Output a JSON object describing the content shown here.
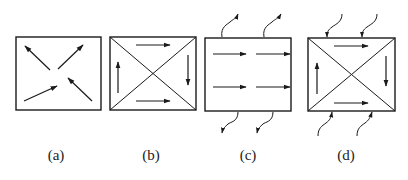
{
  "figure": {
    "ink_color": "#1a1a1a",
    "background": "#ffffff",
    "panels": [
      {
        "id": "a",
        "label": "(a)",
        "box": {
          "x": 16,
          "y": 37,
          "w": 85,
          "h": 73
        },
        "diagonals": false,
        "arrows": [
          {
            "x1": 50,
            "y1": 70,
            "x2": 25,
            "y2": 46
          },
          {
            "x1": 58,
            "y1": 69,
            "x2": 83,
            "y2": 45
          },
          {
            "x1": 24,
            "y1": 101,
            "x2": 57,
            "y2": 86
          },
          {
            "x1": 92,
            "y1": 101,
            "x2": 68,
            "y2": 78
          }
        ],
        "wavy_arrows": []
      },
      {
        "id": "b",
        "label": "(b)",
        "box": {
          "x": 110,
          "y": 37,
          "w": 86,
          "h": 73
        },
        "diagonals": true,
        "arrows": [
          {
            "x1": 136,
            "y1": 45,
            "x2": 170,
            "y2": 45
          },
          {
            "x1": 188,
            "y1": 55,
            "x2": 188,
            "y2": 85
          },
          {
            "x1": 136,
            "y1": 101,
            "x2": 170,
            "y2": 101
          },
          {
            "x1": 118,
            "y1": 93,
            "x2": 118,
            "y2": 62
          }
        ],
        "wavy_arrows": []
      },
      {
        "id": "c",
        "label": "(c)",
        "box": {
          "x": 205,
          "y": 38,
          "w": 86,
          "h": 73
        },
        "diagonals": false,
        "arrows": [
          {
            "x1": 213,
            "y1": 54,
            "x2": 246,
            "y2": 54
          },
          {
            "x1": 256,
            "y1": 54,
            "x2": 290,
            "y2": 54
          },
          {
            "x1": 213,
            "y1": 87,
            "x2": 246,
            "y2": 87
          },
          {
            "x1": 256,
            "y1": 87,
            "x2": 290,
            "y2": 87
          }
        ],
        "wavy_arrows": [
          {
            "d": "M222,37 C220,27 228,24 230,22 C233,19 236,19 238,14",
            "direction": "out"
          },
          {
            "d": "M264,37 C262,27 270,24 272,22 C275,19 278,19 281,14",
            "direction": "out"
          },
          {
            "d": "M238,112 C238,122 230,122 228,124 C225,127 223,128 222,133",
            "direction": "out"
          },
          {
            "d": "M273,112 C273,122 265,122 263,124 C260,127 258,128 257,133",
            "direction": "out"
          }
        ]
      },
      {
        "id": "d",
        "label": "(d)",
        "box": {
          "x": 308,
          "y": 38,
          "w": 87,
          "h": 73
        },
        "diagonals": true,
        "arrows": [
          {
            "x1": 334,
            "y1": 46,
            "x2": 368,
            "y2": 46
          },
          {
            "x1": 386,
            "y1": 56,
            "x2": 386,
            "y2": 86
          },
          {
            "x1": 334,
            "y1": 103,
            "x2": 368,
            "y2": 103
          },
          {
            "x1": 317,
            "y1": 94,
            "x2": 317,
            "y2": 63
          }
        ],
        "wavy_arrows": [
          {
            "d": "M342,14 C342,22 336,24 332,27 C328,30 327,32 327,37",
            "direction": "in"
          },
          {
            "d": "M377,14 C377,22 371,24 367,27 C363,30 362,32 362,37",
            "direction": "in"
          },
          {
            "d": "M318,136 C318,128 322,126 326,123 C330,120 331,118 332,112",
            "direction": "in"
          },
          {
            "d": "M357,136 C357,128 361,126 365,123 C369,120 370,118 372,112",
            "direction": "in"
          }
        ]
      }
    ],
    "label_positions": [
      {
        "x": 56,
        "y": 160
      },
      {
        "x": 151,
        "y": 160
      },
      {
        "x": 248,
        "y": 160
      },
      {
        "x": 346,
        "y": 160
      }
    ]
  }
}
